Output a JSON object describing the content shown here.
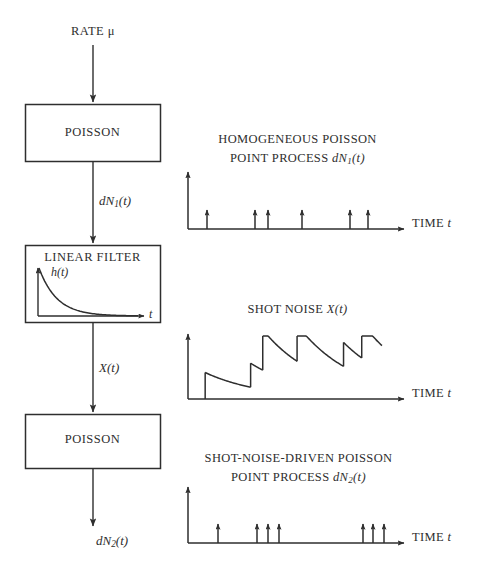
{
  "figure": {
    "type": "block-diagram",
    "background_color": "#ffffff",
    "line_color": "#2e2e2e"
  },
  "flow": {
    "input_label": "RATE μ",
    "blocks": [
      {
        "id": "poisson-1",
        "label": "POISSON"
      },
      {
        "id": "linear-filter",
        "label": "LINEAR FILTER"
      },
      {
        "id": "poisson-2",
        "label": "POISSON"
      }
    ],
    "connections": [
      {
        "id": "rate-in",
        "label": ""
      },
      {
        "id": "dn1",
        "label_prefix": "dN",
        "label_sub": "1",
        "label_suffix": "(t)"
      },
      {
        "id": "xt",
        "label_prefix": "X",
        "label_sub": "",
        "label_suffix": "(t)"
      },
      {
        "id": "dn2",
        "label_prefix": "dN",
        "label_sub": "2",
        "label_suffix": "(t)"
      }
    ]
  },
  "inset": {
    "title_prefix": "h",
    "title_suffix": "(t)",
    "x_axis_label": "t",
    "curve": "exponential-decay"
  },
  "panels": [
    {
      "id": "panel-homogeneous-poisson",
      "title_line1": "HOMOGENEOUS POISSON",
      "title_line2_prefix": "POINT PROCESS ",
      "title_line2_symbol": "dN",
      "title_line2_sub": "1",
      "title_line2_suffix": "(t)",
      "x_axis_label_prefix": "TIME ",
      "x_axis_label_symbol": "t",
      "plot_type": "impulse-train"
    },
    {
      "id": "panel-shot-noise",
      "title_line1": "",
      "title_line2_prefix": "SHOT NOISE ",
      "title_line2_symbol": "X",
      "title_line2_sub": "",
      "title_line2_suffix": "(t)",
      "x_axis_label_prefix": "TIME ",
      "x_axis_label_symbol": "t",
      "plot_type": "shot-noise-waveform"
    },
    {
      "id": "panel-shot-noise-driven-poisson",
      "title_line1": "SHOT-NOISE-DRIVEN POISSON",
      "title_line2_prefix": "POINT PROCESS ",
      "title_line2_symbol": "dN",
      "title_line2_sub": "2",
      "title_line2_suffix": "(t)",
      "x_axis_label_prefix": "TIME ",
      "x_axis_label_symbol": "t",
      "plot_type": "impulse-train"
    }
  ],
  "chart_data": [
    {
      "type": "impulse",
      "id": "panel-homogeneous-poisson",
      "title": "HOMOGENEOUS POISSON POINT PROCESS dN1(t)",
      "xlabel": "TIME t",
      "ylabel": "",
      "grid": false,
      "legend": "none",
      "xlim": [
        0,
        100
      ],
      "ylim": [
        0,
        1
      ],
      "event_times": [
        8.5,
        31,
        37,
        54,
        77,
        86
      ],
      "event_amplitudes": [
        1,
        1,
        1,
        1,
        1,
        1
      ]
    },
    {
      "type": "line",
      "id": "panel-shot-noise",
      "title": "SHOT NOISE X(t)",
      "xlabel": "TIME t",
      "ylabel": "",
      "grid": false,
      "legend": "none",
      "xlim": [
        0,
        100
      ],
      "ylim": [
        0,
        1
      ],
      "event_times": [
        8.5,
        31,
        37,
        54,
        77,
        86
      ],
      "jump_amplitudes": [
        0.42,
        0.38,
        0.64,
        0.58,
        0.38,
        0.56
      ],
      "decay_constant": 28,
      "note": "each arrival adds an exponentially decaying pulse h(t) to the running sum"
    },
    {
      "type": "impulse",
      "id": "panel-shot-noise-driven-poisson",
      "title": "SHOT-NOISE-DRIVEN POISSON POINT PROCESS dN2(t)",
      "xlabel": "TIME t",
      "ylabel": "",
      "grid": false,
      "legend": "none",
      "xlim": [
        0,
        100
      ],
      "ylim": [
        0,
        1
      ],
      "event_times": [
        14,
        32.5,
        37.5,
        42.5,
        82,
        86.5,
        91.5
      ],
      "event_amplitudes": [
        1,
        1,
        1,
        1,
        1,
        1,
        1
      ]
    },
    {
      "type": "line",
      "id": "inset-impulse-response",
      "title": "h(t)",
      "xlabel": "t",
      "ylabel": "",
      "grid": false,
      "legend": "none",
      "xlim": [
        0,
        100
      ],
      "ylim": [
        0,
        1
      ],
      "curve": "exponential-decay",
      "decay_constant": 18
    }
  ]
}
